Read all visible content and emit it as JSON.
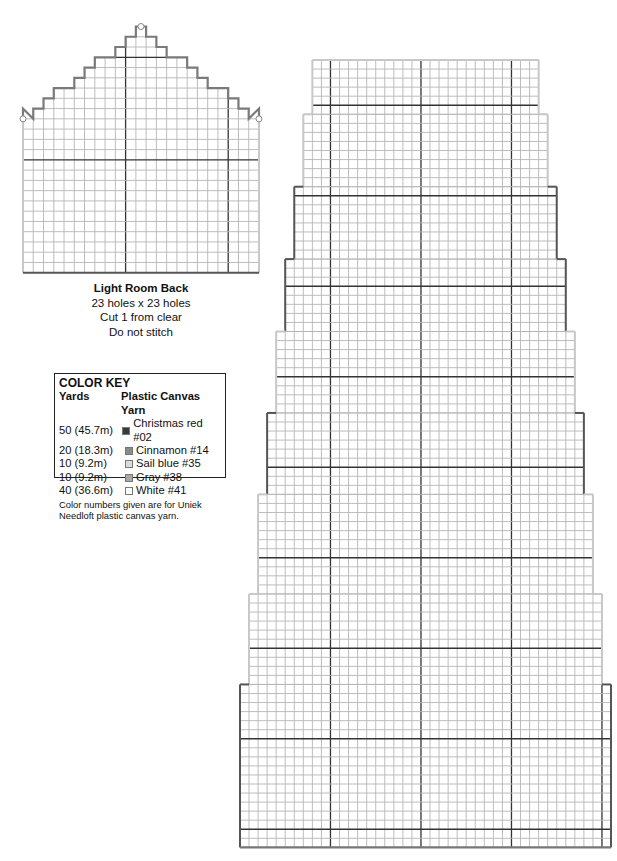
{
  "small_piece": {
    "title": "Light Room Back",
    "size": "23 holes x 23 holes",
    "cut": "Cut 1 from clear",
    "stitch": "Do not stitch",
    "grid": {
      "x": 23,
      "y": 26.5,
      "cell": 10.26,
      "cols": 23,
      "rows": 24,
      "bold_every": 10,
      "bold_offset_col": 0,
      "bold_offset_row": 1
    },
    "outline_steps": [
      [
        11,
        0,
        12,
        0
      ],
      [
        10,
        1,
        13,
        1
      ],
      [
        9,
        2,
        14,
        2
      ],
      [
        7,
        3,
        16,
        3
      ],
      [
        6,
        4,
        17,
        4
      ],
      [
        5,
        5,
        18,
        5
      ],
      [
        3,
        6,
        20,
        6
      ],
      [
        2,
        7,
        21,
        7
      ],
      [
        1,
        8,
        22,
        8
      ],
      [
        0,
        8,
        23,
        8
      ]
    ]
  },
  "color_key": {
    "heading": "COLOR KEY",
    "col_yards": "Yards",
    "col_yarn": "Plastic Canvas Yarn",
    "items": [
      {
        "yards": "50 (45.7m)",
        "name": "Christmas red #02",
        "color": "#3a3a3a"
      },
      {
        "yards": "20 (18.3m)",
        "name": "Cinnamon #14",
        "color": "#8a8a8a"
      },
      {
        "yards": "10 (9.2m)",
        "name": "Sail blue #35",
        "color": "#dcdcdc"
      },
      {
        "yards": "10 (9.2m)",
        "name": "Gray #38",
        "color": "#a8a8a8"
      },
      {
        "yards": "40 (36.6m)",
        "name": "White #41",
        "color": "#ffffff"
      }
    ],
    "note": "Color numbers given are for Uniek Needloft plastic canvas yarn."
  },
  "tower_piece": {
    "cell": 9.05,
    "top_y": 60,
    "center_x": 425.5,
    "bold_first_y": 106,
    "bold_xs": [
      330,
      420,
      511,
      602
    ],
    "tiers": [
      {
        "cols": 25,
        "rows": 6,
        "edge": "#c8c8c8"
      },
      {
        "cols": 27,
        "rows": 8,
        "edge": "#c8c8c8"
      },
      {
        "cols": 29,
        "rows": 8,
        "edge": "#555555"
      },
      {
        "cols": 31,
        "rows": 8,
        "edge": "#555555"
      },
      {
        "cols": 33,
        "rows": 9,
        "edge": "#c8c8c8"
      },
      {
        "cols": 35,
        "rows": 9,
        "edge": "#555555"
      },
      {
        "cols": 37,
        "rows": 11,
        "edge": "#c8c8c8"
      },
      {
        "cols": 39,
        "rows": 10,
        "edge": "#c8c8c8"
      },
      {
        "cols": 41,
        "rows": 18,
        "edge": "#555555"
      }
    ]
  }
}
